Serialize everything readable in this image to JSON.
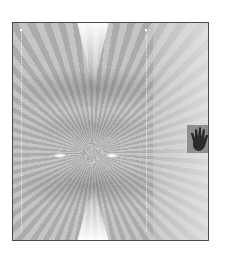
{
  "artwork": {
    "type": "abstract grayscale symmetric pattern",
    "border_color": "#4a4a4a",
    "base_color": "#b8b8b8",
    "highlight_color": "#ffffff"
  },
  "icons": {
    "hand": "hand-icon"
  }
}
